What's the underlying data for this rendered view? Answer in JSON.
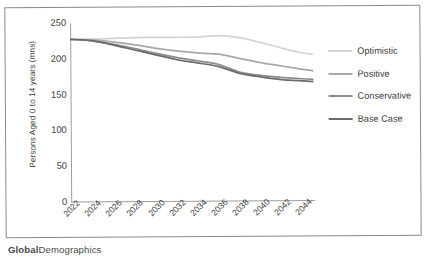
{
  "footer": {
    "brand_bold": "Global",
    "brand_rest": "Demographics"
  },
  "legend": {
    "position": "right",
    "items": [
      {
        "label": "Optimistic",
        "color": "#d3d3d3"
      },
      {
        "label": "Positive",
        "color": "#a8a8a8"
      },
      {
        "label": "Conservative",
        "color": "#8c8c8c"
      },
      {
        "label": "Base Case",
        "color": "#6b6b6b"
      }
    ]
  },
  "chart_data": {
    "type": "line",
    "title": "",
    "xlabel": "",
    "ylabel": "Persons Aged 0 to 14 years (mns)",
    "xlim": [
      2022,
      2045
    ],
    "ylim": [
      0,
      250
    ],
    "yticks": [
      0,
      50,
      100,
      150,
      200,
      250
    ],
    "ytick_labels": [
      "0",
      "50",
      "100",
      "150",
      "200",
      "250"
    ],
    "grid": false,
    "legend_position": "right",
    "x": [
      2022,
      2024,
      2026,
      2028,
      2030,
      2032,
      2034,
      2036,
      2038,
      2040,
      2042,
      2044,
      2045
    ],
    "xtick_labels": [
      "2022",
      "2024",
      "2026",
      "2028",
      "2030",
      "2032",
      "2034",
      "2036",
      "2038",
      "2040",
      "2042",
      "2044"
    ],
    "series": [
      {
        "name": "Optimistic",
        "color": "#d3d3d3",
        "values": [
          228,
          228,
          229,
          230,
          230,
          230,
          230,
          232,
          229,
          222,
          214,
          207,
          205
        ]
      },
      {
        "name": "Positive",
        "color": "#a8a8a8",
        "values": [
          228,
          227,
          224,
          220,
          215,
          211,
          208,
          206,
          200,
          194,
          189,
          184,
          182
        ]
      },
      {
        "name": "Conservative",
        "color": "#8c8c8c",
        "values": [
          228,
          226,
          221,
          215,
          208,
          202,
          197,
          192,
          181,
          176,
          173,
          171,
          170
        ]
      },
      {
        "name": "Base Case",
        "color": "#6b6b6b",
        "values": [
          228,
          226,
          220,
          213,
          206,
          199,
          194,
          189,
          179,
          174,
          170,
          168,
          167
        ]
      }
    ]
  }
}
